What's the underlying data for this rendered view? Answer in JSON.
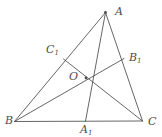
{
  "figure": {
    "kind": "euclidean-geometry-diagram",
    "canvas": {
      "width": 162,
      "height": 137,
      "background": "#ffffff"
    },
    "style": {
      "line_color": "#555555",
      "line_width": 0.9,
      "label_color": "#4d4d4d",
      "dot_color": "#4d4d4d"
    },
    "points": {
      "A": {
        "label": "A",
        "sub": "",
        "x": 105.5,
        "y": 12.5,
        "label_x": 115,
        "label_y": 6,
        "dot": true
      },
      "B": {
        "label": "B",
        "sub": "",
        "x": 14.5,
        "y": 121.5,
        "label_x": 5,
        "label_y": 115,
        "dot": false
      },
      "C": {
        "label": "C",
        "sub": "",
        "x": 142.5,
        "y": 121.0,
        "label_x": 148,
        "label_y": 116,
        "dot": false
      },
      "A1": {
        "label": "A",
        "sub": "1",
        "x": 85.5,
        "y": 121.2,
        "label_x": 80,
        "label_y": 124,
        "dot": false
      },
      "B1": {
        "label": "B",
        "sub": "1",
        "x": 124.0,
        "y": 58.5,
        "label_x": 129,
        "label_y": 52,
        "dot": false
      },
      "C1": {
        "label": "C",
        "sub": "1",
        "x": 63.5,
        "y": 59.0,
        "label_x": 46,
        "label_y": 44,
        "dot": false
      },
      "O": {
        "label": "O",
        "sub": "",
        "x": 86.0,
        "y": 78.0,
        "label_x": 69,
        "label_y": 71,
        "dot": true
      }
    },
    "segments": [
      {
        "name": "side-AB",
        "from": "A",
        "to": "B"
      },
      {
        "name": "side-BC",
        "from": "B",
        "to": "C"
      },
      {
        "name": "side-CA",
        "from": "C",
        "to": "A"
      },
      {
        "name": "cevian-A-A1",
        "from": "A",
        "to": "A1"
      },
      {
        "name": "cevian-B-B1",
        "from": "B",
        "to": "B1"
      },
      {
        "name": "cevian-C-C1",
        "from": "C",
        "to": "C1"
      }
    ],
    "labels_order": [
      "A",
      "C1",
      "B1",
      "O",
      "B",
      "A1",
      "C"
    ]
  }
}
